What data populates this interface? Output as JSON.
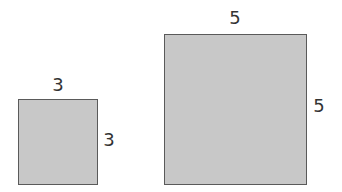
{
  "diagram": {
    "fill_color": "#c8c8c8",
    "border_color": "#5a5a5a",
    "shapes": [
      {
        "name": "small-square",
        "top_label": "3",
        "side_label": "3",
        "box": {
          "left": 18,
          "top": 99,
          "width": 80,
          "height": 86
        }
      },
      {
        "name": "large-square",
        "top_label": "5",
        "side_label": "5",
        "box": {
          "left": 164,
          "top": 34,
          "width": 143,
          "height": 151
        }
      }
    ]
  }
}
